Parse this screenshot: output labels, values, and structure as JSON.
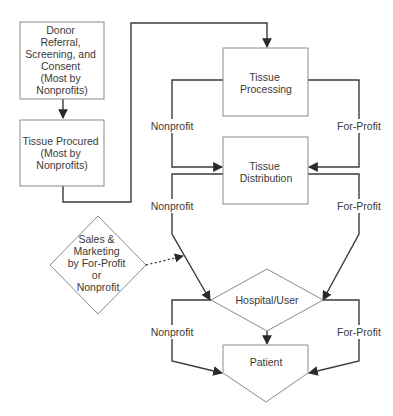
{
  "diagram": {
    "nodes": {
      "donor": {
        "lines": [
          "Donor",
          "Referral,",
          "Screening, and",
          "Consent",
          "(Most by",
          "Nonprofits)"
        ]
      },
      "procured": {
        "lines": [
          "Tissue Procured",
          "(Most by",
          "Nonprofits)"
        ]
      },
      "processing": {
        "lines": [
          "Tissue",
          "Processing"
        ]
      },
      "distribution": {
        "lines": [
          "Tissue",
          "Distribution"
        ]
      },
      "sales": {
        "lines": [
          "Sales &",
          "Marketing",
          "by For-Profit",
          "or",
          "Nonprofit"
        ]
      },
      "hospital": {
        "label": "Hospital/User"
      },
      "patient": {
        "label": "Patient"
      }
    },
    "edge_labels": {
      "proc_to_dist_left": "Nonprofit",
      "proc_to_dist_right": "For-Profit",
      "dist_to_hosp_left": "Nonprofit",
      "dist_to_hosp_right": "For-Profit",
      "hosp_to_patient_left": "Nonprofit",
      "hosp_to_patient_right": "For-Profit"
    }
  }
}
